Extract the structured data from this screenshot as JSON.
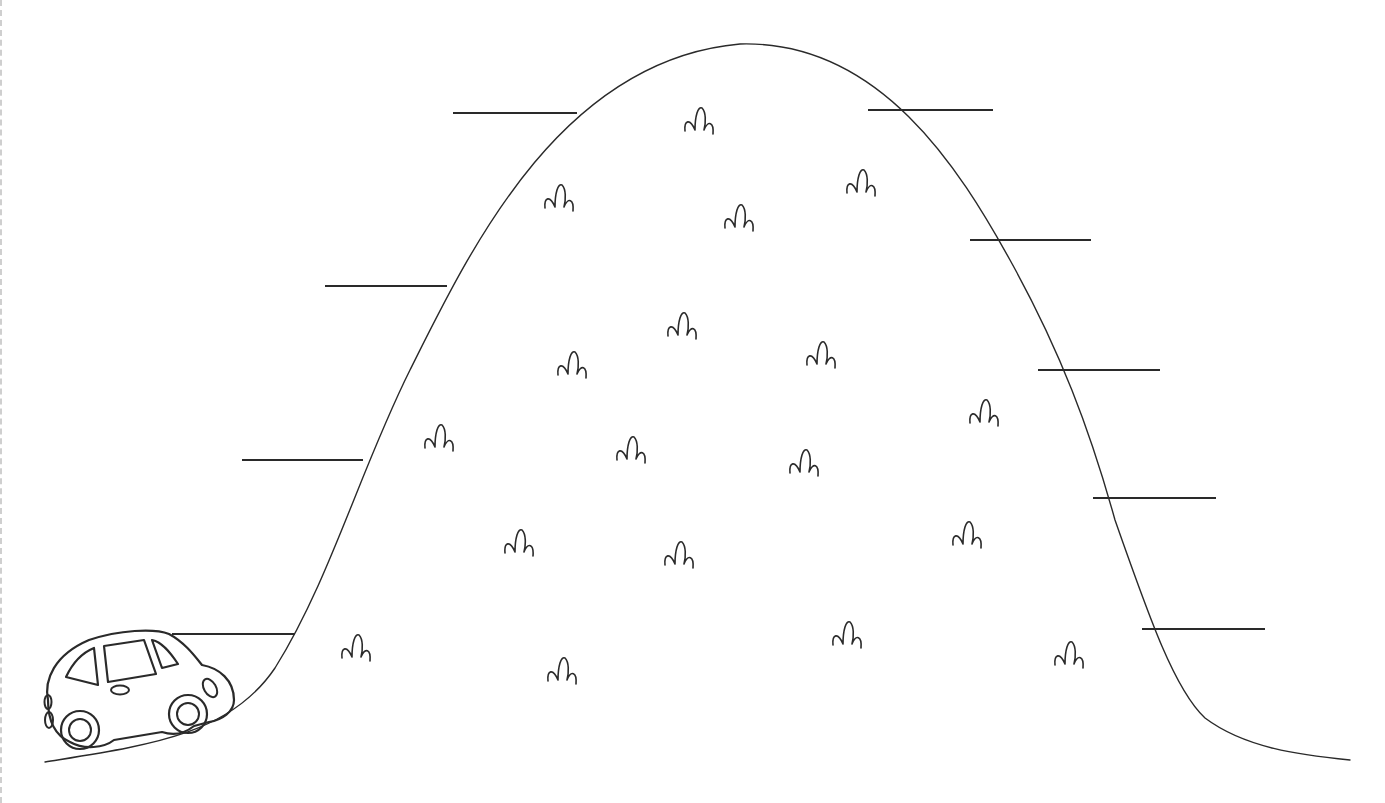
{
  "worksheet": {
    "title": "",
    "colors": {
      "ink": "#2a2a2a",
      "background": "#ffffff",
      "edge": "#cfcfcf"
    },
    "hill": {
      "start": [
        45,
        762
      ],
      "peak": [
        740,
        44
      ],
      "end": [
        1350,
        760
      ]
    },
    "answer_lines": {
      "left": [
        {
          "x1": 453,
          "x2": 577,
          "y": 113
        },
        {
          "x1": 325,
          "x2": 447,
          "y": 286
        },
        {
          "x1": 242,
          "x2": 363,
          "y": 460
        },
        {
          "x1": 172,
          "x2": 295,
          "y": 634
        }
      ],
      "right": [
        {
          "x1": 868,
          "x2": 993,
          "y": 110
        },
        {
          "x1": 970,
          "x2": 1091,
          "y": 240
        },
        {
          "x1": 1038,
          "x2": 1160,
          "y": 370
        },
        {
          "x1": 1093,
          "x2": 1216,
          "y": 498
        },
        {
          "x1": 1142,
          "x2": 1265,
          "y": 629
        }
      ]
    },
    "grass_tufts": [
      [
        700,
        128
      ],
      [
        560,
        205
      ],
      [
        740,
        225
      ],
      [
        862,
        190
      ],
      [
        683,
        333
      ],
      [
        573,
        372
      ],
      [
        822,
        362
      ],
      [
        440,
        445
      ],
      [
        632,
        457
      ],
      [
        985,
        420
      ],
      [
        805,
        470
      ],
      [
        520,
        550
      ],
      [
        680,
        562
      ],
      [
        968,
        542
      ],
      [
        357,
        655
      ],
      [
        563,
        678
      ],
      [
        848,
        642
      ],
      [
        1070,
        662
      ]
    ],
    "car": {
      "icon": "car-icon",
      "position": [
        44,
        630
      ]
    }
  }
}
